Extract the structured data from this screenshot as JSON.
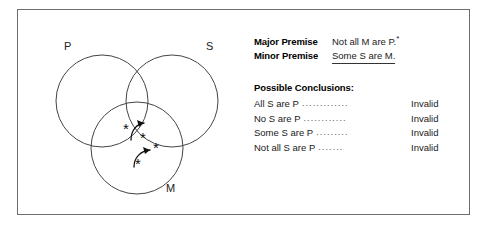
{
  "figure": {
    "diagram": {
      "type": "three-circle-venn",
      "circles": [
        {
          "label": "P",
          "cx": 60,
          "cy": 75,
          "r": 46,
          "label_x": 22,
          "label_y": 24
        },
        {
          "label": "S",
          "cx": 130,
          "cy": 75,
          "r": 46,
          "label_x": 164,
          "label_y": 24
        },
        {
          "label": "M",
          "cx": 95,
          "cy": 122,
          "r": 46,
          "label_x": 124,
          "label_y": 166
        }
      ],
      "marks": [
        {
          "glyph": "*",
          "x": 84,
          "y": 108,
          "region": "P-and-M-not-S"
        },
        {
          "glyph": "*",
          "x": 101,
          "y": 117,
          "region": "P-and-S-and-M"
        },
        {
          "glyph": "*",
          "x": 114,
          "y": 127,
          "region": "S-and-M-not-P"
        },
        {
          "glyph": "*",
          "x": 96,
          "y": 143,
          "region": "M-only"
        }
      ],
      "arrows": [
        {
          "from_x": 88,
          "from_y": 113,
          "to_x": 101,
          "to_y": 100,
          "direction": "up-right"
        },
        {
          "from_x": 92,
          "from_y": 140,
          "to_x": 108,
          "to_y": 126,
          "direction": "up-right"
        }
      ]
    },
    "premises": {
      "major": {
        "name": "Major Premise",
        "text": "Not all M are P.",
        "footnote_mark": "*"
      },
      "minor": {
        "name": "Minor Premise",
        "text": "Some S are M.",
        "underlined": true
      }
    },
    "conclusions": {
      "title": "Possible Conclusions:",
      "items": [
        {
          "claim": "All S are P",
          "verdict": "Invalid",
          "leader": "............."
        },
        {
          "claim": "No S are P",
          "verdict": "Invalid",
          "leader": "............"
        },
        {
          "claim": "Some S are P",
          "verdict": "Invalid",
          "leader": "........."
        },
        {
          "claim": "Not all S are P",
          "verdict": "Invalid",
          "leader": "......."
        }
      ]
    },
    "colors": {
      "frame_border": "#6e6e6e",
      "circle_stroke": "#444444",
      "text": "#1a1a1a",
      "background": "#ffffff"
    }
  }
}
